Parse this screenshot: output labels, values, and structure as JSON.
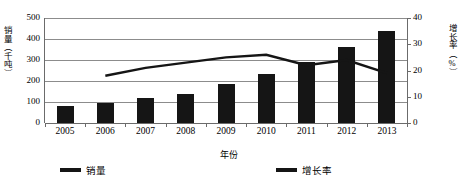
{
  "chart_data": {
    "type": "bar",
    "title": "",
    "xlabel": "年份",
    "categories": [
      "2005",
      "2006",
      "2007",
      "2008",
      "2009",
      "2010",
      "2011",
      "2012",
      "2013"
    ],
    "grid": true,
    "legend_position": "bottom",
    "series": [
      {
        "name": "销量",
        "type": "bar",
        "axis": "left",
        "unit": "千吨",
        "color": "#151515",
        "values": [
          80,
          95,
          118,
          140,
          185,
          235,
          290,
          360,
          440
        ]
      },
      {
        "name": "增长率",
        "type": "line",
        "axis": "right",
        "unit": "%",
        "color": "#151515",
        "values": [
          null,
          18,
          21,
          23,
          25,
          26,
          22,
          24,
          19
        ]
      }
    ],
    "y_left": {
      "label": "销量（千吨）",
      "ticks": [
        "0",
        "100",
        "200",
        "300",
        "400",
        "500"
      ],
      "min": 0,
      "max": 500
    },
    "y_right": {
      "label": "增长率（%）",
      "ticks": [
        "0",
        "10",
        "20",
        "30",
        "40"
      ],
      "min": 0,
      "max": 40
    }
  }
}
